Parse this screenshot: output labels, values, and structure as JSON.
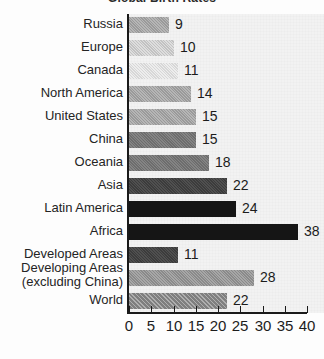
{
  "chart_data": {
    "type": "bar",
    "orientation": "horizontal",
    "title": "Global Birth Rates",
    "xlabel": "",
    "ylabel": "",
    "xlim": [
      0,
      40
    ],
    "grid": false,
    "legend": null,
    "xticks": [
      0,
      5,
      10,
      15,
      20,
      25,
      30,
      35,
      40
    ],
    "xtick_labels": [
      "0",
      "5",
      "10",
      "15",
      "20",
      "25",
      "30",
      "35",
      "40"
    ],
    "categories": [
      "Russia",
      "Europe",
      "Canada",
      "North America",
      "United States",
      "China",
      "Oceania",
      "Asia",
      "Latin America",
      "Africa",
      "Developed Areas",
      "Developing Areas (excluding China)",
      "World"
    ],
    "values": [
      9,
      10,
      11,
      14,
      15,
      15,
      18,
      22,
      24,
      38,
      11,
      28,
      22
    ],
    "value_labels": [
      "9",
      "10",
      "11",
      "14",
      "15",
      "15",
      "18",
      "22",
      "24",
      "38",
      "11",
      "28",
      "22"
    ],
    "bar_tones": [
      "tone-mid",
      "tone-light",
      "tone-vlight",
      "tone-mid",
      "tone-mid",
      "tone-dark",
      "tone-dark",
      "tone-vdark",
      "tone-black",
      "tone-black",
      "tone-vdark",
      "tone-mid2",
      "tone-hatch"
    ]
  },
  "axis": {
    "tick_labels": [
      "0",
      "5",
      "10",
      "15",
      "20",
      "25",
      "30",
      "35",
      "40"
    ]
  },
  "rows": [
    {
      "label": "Russia",
      "value_label": "9",
      "two_line": false
    },
    {
      "label": "Europe",
      "value_label": "10",
      "two_line": false
    },
    {
      "label": "Canada",
      "value_label": "11",
      "two_line": false
    },
    {
      "label": "North America",
      "value_label": "14",
      "two_line": false
    },
    {
      "label": "United States",
      "value_label": "15",
      "two_line": false
    },
    {
      "label": "China",
      "value_label": "15",
      "two_line": false
    },
    {
      "label": "Oceania",
      "value_label": "18",
      "two_line": false
    },
    {
      "label": "Asia",
      "value_label": "22",
      "two_line": false
    },
    {
      "label": "Latin America",
      "value_label": "24",
      "two_line": false
    },
    {
      "label": "Africa",
      "value_label": "38",
      "two_line": false
    },
    {
      "label": "Developed Areas",
      "value_label": "11",
      "two_line": false
    },
    {
      "label": "Developing Areas (excluding China)",
      "value_label": "28",
      "two_line": true
    },
    {
      "label": "World",
      "value_label": "22",
      "two_line": false
    }
  ],
  "colors": {
    "axis": "#1a1a1a",
    "text": "#1c1c1c",
    "plot_background": "#f2f2f2",
    "page_background": "#fdfdfd"
  }
}
